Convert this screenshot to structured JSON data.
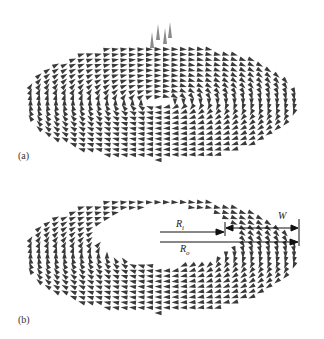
{
  "figure": {
    "panels": [
      {
        "id": "a",
        "label": "(a)",
        "description": "Vortex spin texture on a disk with out-of-plane core",
        "center": [
          160,
          102
        ],
        "rx": 138,
        "ry": 58,
        "hole": null,
        "core_up": true
      },
      {
        "id": "b",
        "label": "(b)",
        "description": "Vortex spin texture on a ring (annulus)",
        "center": [
          160,
          255
        ],
        "rx": 138,
        "ry": 58,
        "hole": {
          "center": [
            168,
            236
          ],
          "rx": 72,
          "ry": 30
        },
        "core_up": false
      }
    ],
    "annotations": {
      "inner_radius": {
        "symbol": "R",
        "sub": "i"
      },
      "outer_radius": {
        "symbol": "R",
        "sub": "o"
      },
      "width": "W"
    },
    "colors": {
      "arrow": "#3a3a3a",
      "core": "#8a8a8a",
      "line": "#111111"
    }
  }
}
